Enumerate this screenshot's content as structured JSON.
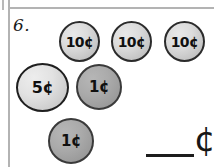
{
  "worksheet": {
    "problem_number": "6.",
    "coins": [
      {
        "label": "10¢",
        "type": "dime",
        "value_cents": 10,
        "name": "coin-dime-1"
      },
      {
        "label": "10¢",
        "type": "dime",
        "value_cents": 10,
        "name": "coin-dime-2"
      },
      {
        "label": "10¢",
        "type": "dime",
        "value_cents": 10,
        "name": "coin-dime-3"
      },
      {
        "label": "5¢",
        "type": "nickel",
        "value_cents": 5,
        "name": "coin-nickel-1"
      },
      {
        "label": "1¢",
        "type": "penny",
        "value_cents": 1,
        "name": "coin-penny-1"
      },
      {
        "label": "1¢",
        "type": "penny",
        "value_cents": 1,
        "name": "coin-penny-2"
      }
    ],
    "answer": {
      "value": "",
      "placeholder": "",
      "unit_symbol": "¢"
    },
    "colors": {
      "rule_line": "#b3b3b3",
      "ink": "#1a1a1a",
      "dime_face": "#dcdcdc",
      "nickel_face": "#e2e2e2",
      "penny_face": "#ababab",
      "coin_outline": "#2b2b2b"
    }
  }
}
